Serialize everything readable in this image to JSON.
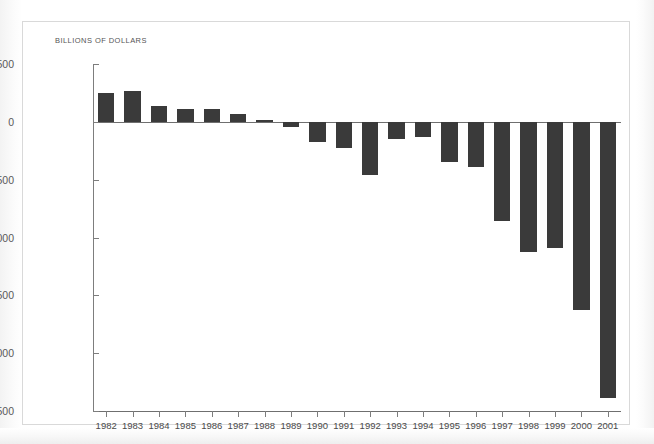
{
  "chart_data": {
    "type": "bar",
    "title": "",
    "subtitle": "",
    "axis_title": "BILLIONS OF DOLLARS",
    "xlabel": "",
    "ylabel": "BILLIONS OF DOLLARS",
    "ylim": [
      -2500,
      500
    ],
    "grid": false,
    "legend": "none",
    "bar_color": "#3a3a3a",
    "categories": [
      "1982",
      "1983",
      "1984",
      "1985",
      "1986",
      "1987",
      "1988",
      "1989",
      "1990",
      "1991",
      "1992",
      "1993",
      "1994",
      "1995",
      "1996",
      "1997",
      "1998",
      "1999",
      "2000",
      "2001"
    ],
    "values": [
      250,
      265,
      140,
      110,
      110,
      70,
      15,
      -45,
      -175,
      -230,
      -460,
      -150,
      -130,
      -350,
      -390,
      -855,
      -1125,
      -1090,
      -1625,
      -2385
    ],
    "y_ticks": [
      500,
      0,
      -500,
      -1000,
      -1500,
      -2000,
      -2500
    ],
    "y_tick_labels": [
      "500",
      "0",
      "−500",
      "−1000",
      "−1,500",
      "−2,000",
      "−2,500"
    ]
  }
}
